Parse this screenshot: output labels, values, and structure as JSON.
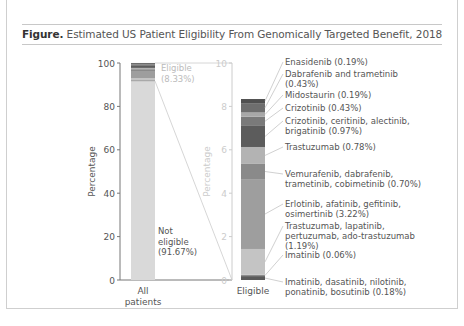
{
  "figure": {
    "label": "Figure.",
    "title": "Estimated US Patient Eligibility From Genomically Targeted Benefit, 2018"
  },
  "chart_data": [
    {
      "type": "bar",
      "stacked": true,
      "name": "all-patients",
      "categories": [
        "All patients"
      ],
      "category_lines": [
        "All",
        "patients"
      ],
      "ylabel": "Percentage",
      "ylim": [
        0,
        100
      ],
      "yticks": [
        0,
        20,
        40,
        60,
        80,
        100
      ],
      "series": [
        {
          "name": "Not eligible",
          "label_lines": [
            "Not",
            "eligible",
            "(91.67%)"
          ],
          "values": [
            91.67
          ],
          "color": "#d9d9d9"
        },
        {
          "name": "Eligible",
          "label_lines": [
            "Eligible",
            "(8.33%)"
          ],
          "values": [
            8.33
          ],
          "color": "#9a9a9a"
        }
      ]
    },
    {
      "type": "bar",
      "stacked": true,
      "name": "eligible",
      "categories": [
        "Eligible"
      ],
      "category_lines": [
        "Eligible"
      ],
      "ylabel": "Percentage",
      "ylim": [
        0,
        10
      ],
      "yticks": [
        0,
        2,
        4,
        6,
        8,
        10
      ],
      "series": [
        {
          "name": "Imatinib, dasatinib, nilotinib, ponatinib, bosutinib",
          "label_lines": [
            "Imatinib, dasatinib, nilotinib,",
            "ponatinib, bosutinib (0.18%)"
          ],
          "values": [
            0.18
          ],
          "color": "#5a5a5a"
        },
        {
          "name": "Imatinib",
          "label_lines": [
            "Imatinib (0.06%)"
          ],
          "values": [
            0.06
          ],
          "color": "#8c8c8c"
        },
        {
          "name": "Trastuzumab, lapatinib, pertuzumab, ado-trastuzumab",
          "label_lines": [
            "Trastuzumab, lapatinib,",
            "pertuzumab, ado-trastuzumab",
            "(1.19%)"
          ],
          "values": [
            1.19
          ],
          "color": "#c4c4c4"
        },
        {
          "name": "Erlotinib, afatinib, gefitinib, osimertinib",
          "label_lines": [
            "Erlotinib, afatinib, gefitinib,",
            "osimertinib (3.22%)"
          ],
          "values": [
            3.22
          ],
          "color": "#9e9e9e"
        },
        {
          "name": "Vemurafenib, dabrafenib, trametinib, cobimetinib",
          "label_lines": [
            "Vemurafenib, dabrafenib,",
            "trametinib, cobimetinib (0.70%)"
          ],
          "values": [
            0.7
          ],
          "color": "#8a8a8a"
        },
        {
          "name": "Trastuzumab",
          "label_lines": [
            "Trastuzumab (0.78%)"
          ],
          "values": [
            0.78
          ],
          "color": "#b3b3b3"
        },
        {
          "name": "Crizotinib, ceritinib, alectinib, brigatinib",
          "label_lines": [
            "Crizotinib, ceritinib, alectinib,",
            "brigatinib (0.97%)"
          ],
          "values": [
            0.97
          ],
          "color": "#5c5c5c"
        },
        {
          "name": "Crizotinib",
          "label_lines": [
            "Crizotinib (0.43%)"
          ],
          "values": [
            0.43
          ],
          "color": "#7a7a7a"
        },
        {
          "name": "Midostaurin",
          "label_lines": [
            "Midostaurin (0.19%)"
          ],
          "values": [
            0.19
          ],
          "color": "#a8a8a8"
        },
        {
          "name": "Dabrafenib and trametinib",
          "label_lines": [
            "Dabrafenib and trametinib",
            "(0.43%)"
          ],
          "values": [
            0.43
          ],
          "color": "#6e6e6e"
        },
        {
          "name": "Enasidenib",
          "label_lines": [
            "Enasidenib (0.19%)"
          ],
          "values": [
            0.19
          ],
          "color": "#505050"
        }
      ]
    }
  ]
}
